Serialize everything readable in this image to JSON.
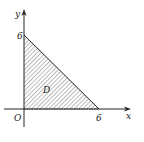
{
  "figure": {
    "labels": {
      "y_axis": "y",
      "x_axis": "x",
      "origin": "O",
      "y_intercept": "6",
      "x_intercept": "6",
      "region": "D"
    },
    "region": {
      "shape": "triangle",
      "vertices": [
        [
          0,
          0
        ],
        [
          6,
          0
        ],
        [
          0,
          6
        ]
      ],
      "fill": "hatched"
    },
    "colors": {
      "stroke": "#222222",
      "hatch": "#555555"
    }
  }
}
